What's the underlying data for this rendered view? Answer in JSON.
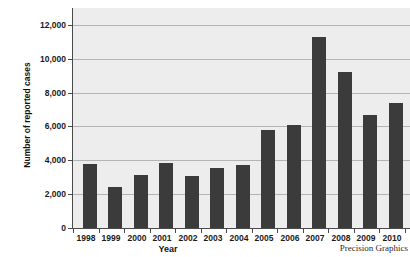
{
  "chart_data": {
    "type": "bar",
    "title": "",
    "xlabel": "Year",
    "ylabel": "Number of reported cases",
    "categories": [
      "1998",
      "1999",
      "2000",
      "2001",
      "2002",
      "2003",
      "2004",
      "2005",
      "2006",
      "2007",
      "2008",
      "2009",
      "2010"
    ],
    "values": [
      3800,
      2400,
      3150,
      3850,
      3050,
      3550,
      3700,
      5800,
      6100,
      11300,
      9200,
      6700,
      7400
    ],
    "ylim": [
      0,
      13000
    ],
    "yticks": [
      0,
      2000,
      4000,
      6000,
      8000,
      10000,
      12000
    ],
    "ytick_labels": [
      "0",
      "2,000",
      "4,000",
      "6,000",
      "8,000",
      "10,000",
      "12,000"
    ],
    "grid": true,
    "legend": false,
    "bar_color": "#3b3b3b",
    "plot_background": "#ededed",
    "credit": "Precision Graphics"
  }
}
